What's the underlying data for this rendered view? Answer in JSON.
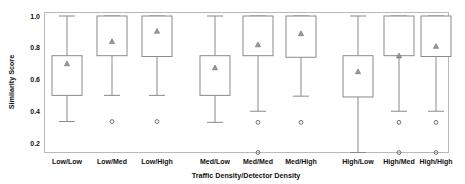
{
  "chart_data": {
    "type": "box",
    "title": "",
    "xlabel": "Traffic Density/Detector Density",
    "ylabel": "Similarity Score",
    "ylim": [
      0.1,
      1.05
    ],
    "yticks": [
      0.2,
      0.4,
      0.6,
      0.8,
      1.0
    ],
    "ytick_labels": [
      "0.2",
      "0.4",
      "0.6",
      "0.8",
      "1.0"
    ],
    "grid": false,
    "legend": "none",
    "categories": [
      "Low/Low",
      "Low/Med",
      "Low/High",
      "Med/Low",
      "Med/Med",
      "Med/High",
      "High/Low",
      "High/Med",
      "High/High"
    ],
    "groups": [
      "Low",
      "Med",
      "High"
    ],
    "marker_notes": {
      "mean": "triangle",
      "outlier": "open-circle"
    },
    "boxes": [
      {
        "category": "Low/Low",
        "whisker_low": 0.335,
        "q1": 0.5,
        "median": 0.75,
        "q3": 0.75,
        "whisker_high": 1.0,
        "mean": 0.7,
        "outliers": []
      },
      {
        "category": "Low/Med",
        "whisker_low": 0.5,
        "q1": 0.75,
        "median": 1.0,
        "q3": 1.0,
        "whisker_high": 1.0,
        "mean": 0.84,
        "outliers": [
          0.335
        ]
      },
      {
        "category": "Low/High",
        "whisker_low": 0.5,
        "q1": 0.745,
        "median": 1.0,
        "q3": 1.0,
        "whisker_high": 1.0,
        "mean": 0.905,
        "outliers": [
          0.335
        ]
      },
      {
        "category": "Med/Low",
        "whisker_low": 0.33,
        "q1": 0.5,
        "median": 0.75,
        "q3": 0.75,
        "whisker_high": 1.0,
        "mean": 0.675,
        "outliers": []
      },
      {
        "category": "Med/Med",
        "whisker_low": 0.4,
        "q1": 0.75,
        "median": 1.0,
        "q3": 1.0,
        "whisker_high": 1.0,
        "mean": 0.82,
        "outliers": [
          0.33,
          0.14
        ]
      },
      {
        "category": "Med/High",
        "whisker_low": 0.495,
        "q1": 0.74,
        "median": 1.0,
        "q3": 1.0,
        "whisker_high": 1.0,
        "mean": 0.89,
        "outliers": [
          0.33
        ]
      },
      {
        "category": "High/Low",
        "whisker_low": 0.14,
        "q1": 0.49,
        "median": 0.75,
        "q3": 0.75,
        "whisker_high": 1.0,
        "mean": 0.65,
        "outliers": []
      },
      {
        "category": "High/Med",
        "whisker_low": 0.4,
        "q1": 0.75,
        "median": 1.0,
        "q3": 1.0,
        "whisker_high": 1.0,
        "mean": 0.75,
        "outliers": [
          0.33,
          0.14
        ]
      },
      {
        "category": "High/High",
        "whisker_low": 0.4,
        "q1": 0.745,
        "median": 1.0,
        "q3": 1.0,
        "whisker_high": 1.0,
        "mean": 0.81,
        "outliers": [
          0.33,
          0.14
        ]
      }
    ]
  },
  "colors": {
    "frame": "#b9b9b9",
    "box_stroke": "#8a8a8a",
    "mean_marker": "#9a9a9a",
    "outlier_stroke": "#6d6d6d",
    "text": "#111111",
    "background": "#ffffff"
  }
}
